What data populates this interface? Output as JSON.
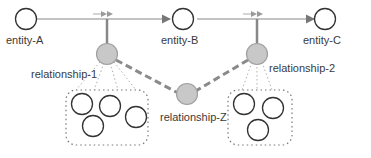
{
  "diagram": {
    "entities": [
      {
        "id": "entity-A",
        "label": "entity-A"
      },
      {
        "id": "entity-B",
        "label": "entity-B"
      },
      {
        "id": "entity-C",
        "label": "entity-C"
      }
    ],
    "relationships": [
      {
        "id": "relationship-1",
        "label": "relationship-1",
        "group_size": 4
      },
      {
        "id": "relationship-2",
        "label": "relationship-2",
        "group_size": 3
      },
      {
        "id": "relationship-Z",
        "label": "relationship-Z"
      }
    ],
    "edges": [
      {
        "from": "entity-A",
        "to": "entity-B",
        "style": "solid-arrow"
      },
      {
        "from": "entity-B",
        "to": "entity-C",
        "style": "solid-arrow"
      },
      {
        "from": "relationship-1",
        "to": "relationship-Z",
        "style": "dashed"
      },
      {
        "from": "relationship-2",
        "to": "relationship-Z",
        "style": "dashed"
      }
    ],
    "colors": {
      "line": "#777777",
      "relationship_fill": "#c8c8c8",
      "relationship_stroke": "#a0a0a0",
      "dashed": "#8a8a8a",
      "text": "#3a3a3a"
    }
  }
}
